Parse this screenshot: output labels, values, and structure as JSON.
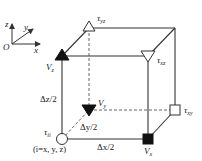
{
  "diagram": {
    "type": "staggered-grid-cell",
    "axes": {
      "origin": "O",
      "x": "x",
      "y": "y",
      "z": "z"
    },
    "labels": {
      "tau_yz": "τ",
      "tau_yz_sub": "yz",
      "tau_xz": "τ",
      "tau_xz_sub": "xz",
      "tau_xy": "τ",
      "tau_xy_sub": "xy",
      "tau_ii": "τ",
      "tau_ii_sub": "ii",
      "tau_ii_note": "(i=x, y, z)",
      "v_z": "V",
      "v_z_sub": "z",
      "v_y": "V",
      "v_y_sub": "y",
      "v_x": "V",
      "v_x_sub": "x",
      "dz": "Δz/2",
      "dy": "Δy/2",
      "dx": "Δx/2"
    },
    "colors": {
      "line": "#333333",
      "dashed": "#555555",
      "filled": "#111111",
      "hollow": "#ffffff"
    }
  }
}
